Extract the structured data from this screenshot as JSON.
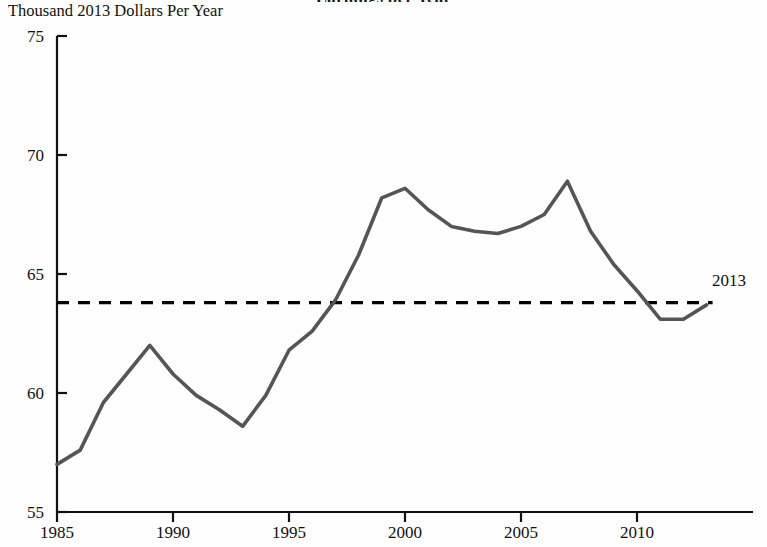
{
  "figure": {
    "cut_off_title": "Earnings per Year",
    "unit_label": "Thousand 2013 Dollars Per Year"
  },
  "axes": {
    "y_ticks": [
      "75",
      "70",
      "65",
      "60",
      "55"
    ],
    "x_ticks": [
      "1985",
      "1990",
      "1995",
      "2000",
      "2005",
      "2010"
    ]
  },
  "annotations": {
    "reference_line_label": "2013"
  },
  "colors": {
    "series_line": "#555555",
    "reference_line": "#000000",
    "axis": "#111111",
    "background": "#ffffff"
  },
  "chart_data": {
    "type": "line",
    "title": "Earnings per Year",
    "xlabel": "",
    "ylabel": "Thousand 2013 Dollars Per Year",
    "xlim": [
      1985,
      2013
    ],
    "ylim": [
      55,
      75
    ],
    "yticks": [
      55,
      60,
      65,
      70,
      75
    ],
    "xticks": [
      1985,
      1990,
      1995,
      2000,
      2005,
      2010
    ],
    "grid": false,
    "legend": "none",
    "x": [
      1985,
      1986,
      1987,
      1988,
      1989,
      1990,
      1991,
      1992,
      1993,
      1994,
      1995,
      1996,
      1997,
      1998,
      1999,
      2000,
      2001,
      2002,
      2003,
      2004,
      2005,
      2006,
      2007,
      2008,
      2009,
      2010,
      2011,
      2012,
      2013
    ],
    "series": [
      {
        "name": "Thousand 2013 Dollars Per Year",
        "values": [
          57.0,
          57.6,
          59.6,
          60.8,
          62.0,
          60.8,
          59.9,
          59.3,
          58.6,
          59.9,
          61.8,
          62.6,
          63.9,
          65.8,
          68.2,
          68.6,
          67.7,
          67.0,
          66.8,
          66.7,
          67.0,
          67.5,
          68.9,
          66.8,
          65.4,
          64.3,
          63.1,
          63.1,
          63.7
        ]
      }
    ],
    "reference_line": {
      "label": "2013",
      "value": 63.8,
      "style": "dashed",
      "orientation": "horizontal"
    }
  }
}
